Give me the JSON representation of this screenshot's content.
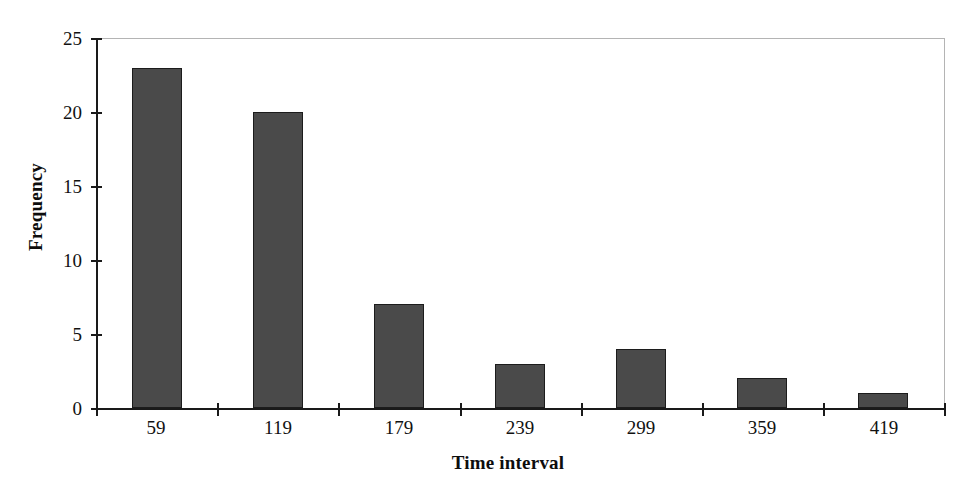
{
  "chart_data": {
    "type": "bar",
    "title": "",
    "subtitle": "",
    "xlabel": "Time interval",
    "ylabel": "Frequency",
    "categories": [
      "59",
      "119",
      "179",
      "239",
      "299",
      "359",
      "419"
    ],
    "values": [
      23,
      20,
      7,
      3,
      4,
      2,
      1
    ],
    "series": [
      {
        "name": "Frequency",
        "values": [
          23,
          20,
          7,
          3,
          4,
          2,
          1
        ]
      }
    ],
    "ylim": [
      0,
      25
    ],
    "yticks": [
      0,
      5,
      10,
      15,
      20,
      25
    ],
    "ytick_labels": [
      "0",
      "5",
      "10",
      "15",
      "20",
      "25"
    ],
    "xtick_labels": [
      "59",
      "119",
      "179",
      "239",
      "299",
      "359",
      "419"
    ],
    "grid": false,
    "legend": false,
    "legend_position": "none",
    "annotations": [],
    "colors": {
      "bar_fill": "#4a4a4a",
      "bar_border": "#1c1c1c",
      "axis": "#1a1a1a",
      "frame": "#b4b4b4",
      "background": "#ffffff",
      "text": "#111111"
    }
  }
}
